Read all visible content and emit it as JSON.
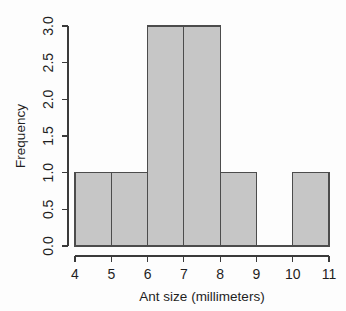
{
  "chart_data": {
    "type": "bar",
    "subtype": "histogram",
    "title": "",
    "xlabel": "Ant size (millimeters)",
    "ylabel": "Frequency",
    "xlim": [
      4,
      11
    ],
    "ylim": [
      0,
      3
    ],
    "xticks": [
      "4",
      "5",
      "6",
      "7",
      "8",
      "9",
      "10",
      "11"
    ],
    "xtick_values": [
      4,
      5,
      6,
      7,
      8,
      9,
      10,
      11
    ],
    "yticks": [
      "0.0",
      "0.5",
      "1.0",
      "1.5",
      "2.0",
      "2.5",
      "3.0"
    ],
    "ytick_values": [
      0.0,
      0.5,
      1.0,
      1.5,
      2.0,
      2.5,
      3.0
    ],
    "bin_width": 1,
    "bin_edges": [
      4,
      5,
      6,
      7,
      8,
      9,
      10,
      11
    ],
    "categories": [
      "4-5",
      "5-6",
      "6-7",
      "7-8",
      "8-9",
      "9-10",
      "10-11"
    ],
    "values": [
      1,
      1,
      3,
      3,
      1,
      0,
      1
    ],
    "bars": [
      {
        "from": 4,
        "to": 5,
        "frequency": 1
      },
      {
        "from": 5,
        "to": 6,
        "frequency": 1
      },
      {
        "from": 6,
        "to": 7,
        "frequency": 3
      },
      {
        "from": 7,
        "to": 8,
        "frequency": 3
      },
      {
        "from": 8,
        "to": 9,
        "frequency": 1
      },
      {
        "from": 9,
        "to": 10,
        "frequency": 0
      },
      {
        "from": 10,
        "to": 11,
        "frequency": 1
      }
    ],
    "grid": false,
    "legend": false,
    "colors": {
      "bar_fill": "#c6c6c6",
      "bar_stroke": "#4c4c4c",
      "axis": "#3a3a3a",
      "text": "#1f1f1f",
      "background": "#fdfdfd"
    },
    "ylabel_rotation": -90,
    "ytick_rotation": -90
  }
}
